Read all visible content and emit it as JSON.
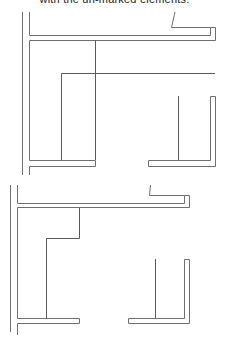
{
  "caption": "with the un-marked elements.",
  "colors": {
    "line": "#6f6f6f",
    "background": "#ffffff"
  },
  "diagrams": [
    {
      "id": "top",
      "description": "plan outline with horizontal partition and L-shaped right wall"
    },
    {
      "id": "bottom",
      "description": "plan outline with stepped partition and L-shaped right wall"
    }
  ]
}
